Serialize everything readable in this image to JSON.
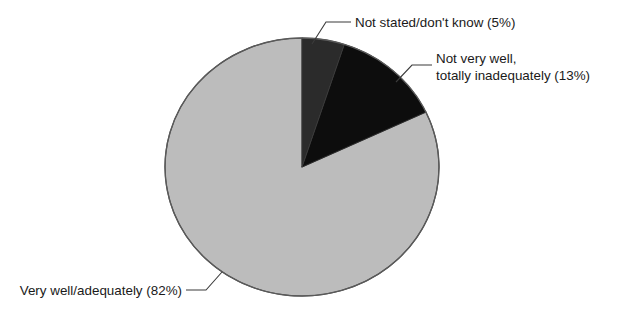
{
  "chart_data": {
    "type": "pie",
    "title": "",
    "subtitle": "",
    "xlabel": "",
    "ylabel": "",
    "legend_position": "none",
    "grid": false,
    "units": "percent",
    "total": 100,
    "start_angle_deg": 0,
    "direction": "clockwise",
    "categories": [
      "Not stated/don't know",
      "Not very well, totally inadequately",
      "Very well/adequately"
    ],
    "values": [
      5,
      13,
      82
    ],
    "slices": [
      {
        "id": "not-stated",
        "label": "Not stated/don't know (5%)",
        "label_lines": [
          "Not stated/don't know (5%)"
        ],
        "category": "Not stated/don't know",
        "value": 5,
        "value_text": "5%",
        "color": "#2b2b2b",
        "start_deg": 0,
        "end_deg": 18
      },
      {
        "id": "not-very-well",
        "label": "Not very well, totally inadequately (13%)",
        "label_lines": [
          "Not very well,",
          "totally inadequately (13%)"
        ],
        "category": "Not very well, totally inadequately",
        "value": 13,
        "value_text": "13%",
        "color": "#0d0d0d",
        "start_deg": 18,
        "end_deg": 64.8
      },
      {
        "id": "very-well",
        "label": "Very well/adequately (82%)",
        "label_lines": [
          "Very well/adequately (82%)"
        ],
        "category": "Very well/adequately",
        "value": 82,
        "value_text": "82%",
        "color": "#bcbcbc",
        "start_deg": 64.8,
        "end_deg": 360
      }
    ],
    "colors": {
      "slice_not_stated": "#2b2b2b",
      "slice_not_very_well": "#0d0d0d",
      "slice_very_well": "#bcbcbc",
      "outline": "#4a4a4a",
      "leader_line": "#3b3b3b",
      "text": "#1a1a1a",
      "background": "#ffffff"
    }
  }
}
